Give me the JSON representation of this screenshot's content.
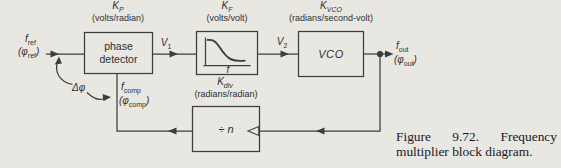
{
  "figure": {
    "caption": "Figure 9.72. Frequency multiplier block diagram."
  },
  "colors": {
    "background": "#e9e7e2",
    "ink": "#3d3d3d",
    "text": "#2f2f2f",
    "caption_text": "#191919"
  },
  "blocks": {
    "phase_detector": {
      "line1": "phase",
      "line2": "detector",
      "gain_base": "K",
      "gain_sub": "P",
      "units": "(volts/radian)"
    },
    "loop_filter": {
      "gain_base": "K",
      "gain_sub": "F",
      "units": "(volts/volt)",
      "axis_label": "f"
    },
    "vco": {
      "label": "VCO",
      "gain_base": "K",
      "gain_sub": "VCO",
      "units": "(radians/second-volt)"
    },
    "divider": {
      "label_op": "÷",
      "label_var": "n",
      "gain_base": "K",
      "gain_sub": "div",
      "units": "(radians/radian)"
    }
  },
  "signals": {
    "input_f": {
      "base": "f",
      "sub": "ref"
    },
    "input_phi": {
      "pre": "(φ",
      "sub": "ref",
      "post": ")"
    },
    "output_f": {
      "base": "f",
      "sub": "out"
    },
    "output_phi": {
      "pre": "(φ",
      "sub": "out",
      "post": ")"
    },
    "comp_f": {
      "base": "f",
      "sub": "comp"
    },
    "comp_phi": {
      "pre": "(φ",
      "sub": "comp",
      "post": ")"
    },
    "v1": {
      "base": "V",
      "sub": "1"
    },
    "v2": {
      "base": "V",
      "sub": "2"
    },
    "phase_error": "Δφ"
  }
}
